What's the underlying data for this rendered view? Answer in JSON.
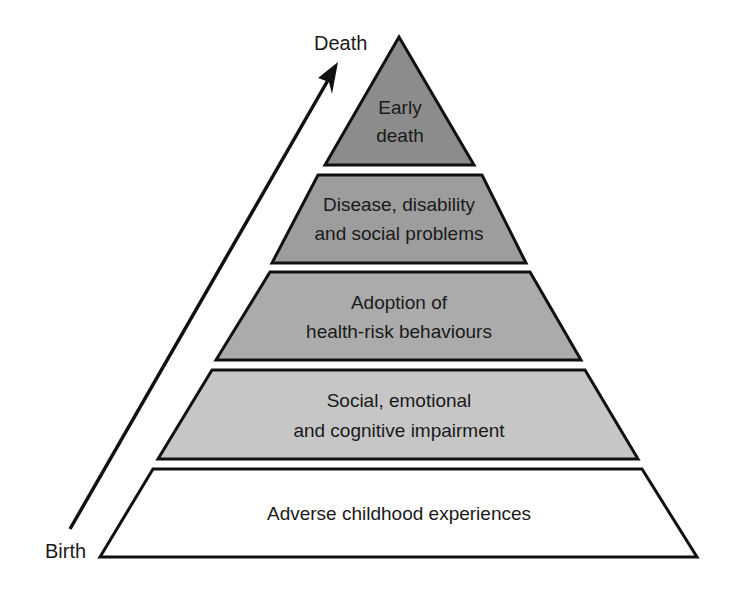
{
  "diagram": {
    "type": "pyramid",
    "axis": {
      "start_label": "Birth",
      "end_label": "Death",
      "direction": "upward"
    },
    "tiers": [
      {
        "level": 1,
        "line1": "Early",
        "line2": "death",
        "fill": "#8c8c8c"
      },
      {
        "level": 2,
        "line1": "Disease, disability",
        "line2": "and social problems",
        "fill": "#9d9d9d"
      },
      {
        "level": 3,
        "line1": "Adoption of",
        "line2": "health-risk behaviours",
        "fill": "#ababab"
      },
      {
        "level": 4,
        "line1": "Social, emotional",
        "line2": "and cognitive impairment",
        "fill": "#c6c6c6"
      },
      {
        "level": 5,
        "line1": "Adverse childhood experiences",
        "line2": "",
        "fill": "#ffffff"
      }
    ]
  }
}
